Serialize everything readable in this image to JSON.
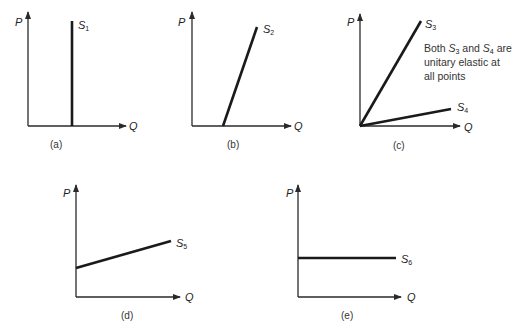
{
  "axes": {
    "y_label": "P",
    "x_label": "Q"
  },
  "panels": [
    {
      "id": "a",
      "caption": "(a)",
      "curve": {
        "symbol": "S",
        "subscript": "1",
        "shape": "vertical"
      }
    },
    {
      "id": "b",
      "caption": "(b)",
      "curve": {
        "symbol": "S",
        "subscript": "2",
        "shape": "steep line from positive Q intercept"
      }
    },
    {
      "id": "c",
      "caption": "(c)",
      "curves": [
        {
          "symbol": "S",
          "subscript": "3",
          "shape": "steep ray from origin"
        },
        {
          "symbol": "S",
          "subscript": "4",
          "shape": "shallow ray from origin"
        }
      ],
      "note": {
        "line1_prefix": "Both ",
        "s3": "S",
        "s3_sub": "3",
        "and": " and ",
        "s4": "S",
        "s4_sub": "4",
        "line1_suffix": " are",
        "line2": "unitary elastic at",
        "line3": "all points"
      }
    },
    {
      "id": "d",
      "caption": "(d)",
      "curve": {
        "symbol": "S",
        "subscript": "5",
        "shape": "shallow line from positive P intercept"
      }
    },
    {
      "id": "e",
      "caption": "(e)",
      "curve": {
        "symbol": "S",
        "subscript": "6",
        "shape": "horizontal"
      }
    }
  ]
}
